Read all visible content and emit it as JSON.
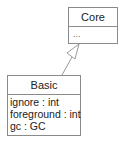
{
  "diagram": {
    "classes": [
      {
        "name": "Core",
        "attributes": [
          "..."
        ]
      },
      {
        "name": "Basic",
        "attributes": [
          "ignore : int",
          "foreground : int",
          "gc : GC"
        ]
      }
    ],
    "relations": [
      {
        "type": "generalization",
        "from": "Basic",
        "to": "Core"
      }
    ]
  }
}
